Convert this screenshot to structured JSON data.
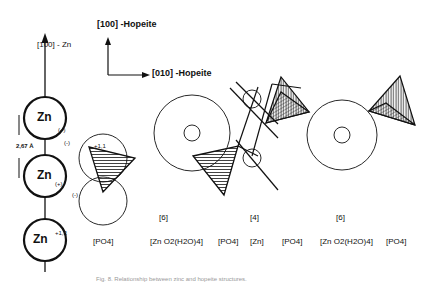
{
  "axes": {
    "zn_axis_label": "[100] - Zn",
    "hopeite_vertical_label": "[100] -Hopeite",
    "hopeite_horizontal_label": "[010] -Hopeite"
  },
  "zn_chain": {
    "atoms": [
      {
        "label": "Zn",
        "charge": "(+)"
      },
      {
        "label": "Zn",
        "charge": "(+)"
      },
      {
        "label": "Zn",
        "charge": "+1,3"
      }
    ],
    "distance_label": "2,67 Å"
  },
  "pho4_circle_charges": {
    "upper": "(-)",
    "lower": "(-)",
    "vertex": "+1,1"
  },
  "coordination_labels": [
    "[6]",
    "[4]",
    "[6]"
  ],
  "bottom_labels": [
    "[PO4]",
    "[Zn O2(H2O)4]",
    "[PO4]",
    "[Zn]",
    "[PO4]",
    "[Zn O2(H2O)4]",
    "[PO4]"
  ],
  "caption": "Fig. 8. Relationship between zinc and hopeite structures."
}
